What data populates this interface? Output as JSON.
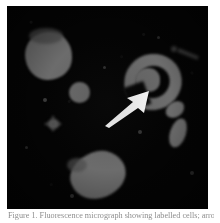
{
  "figure": {
    "caption_label": "Figure 1.",
    "caption_text": "Figure 1.  Fluorescence micrograph showing labelled cells; arrow indicates ring-shaped cell.",
    "panel_background_color": "#040404",
    "cell_color": "#6c6c6c",
    "arrow_color": "#ffffff",
    "page_background_color": "#ffffff"
  },
  "micrograph": {
    "name": "fluorescence-micrograph",
    "annotation": {
      "type": "arrow",
      "direction": "up-right",
      "points_at": "ring-shaped-cell",
      "color": "#ffffff"
    },
    "objects": [
      {
        "id": "cell-top-left",
        "shape": "round-blob",
        "x": 18,
        "y": 26,
        "w": 47,
        "h": 48
      },
      {
        "id": "cell-mid-left",
        "shape": "small-blob",
        "x": 62,
        "y": 76,
        "w": 21,
        "h": 21
      },
      {
        "id": "cell-ring",
        "shape": "ring",
        "x": 117,
        "y": 48,
        "w": 58,
        "h": 56
      },
      {
        "id": "cell-right-upper",
        "shape": "oval-blob",
        "x": 160,
        "y": 98,
        "w": 19,
        "h": 16
      },
      {
        "id": "cell-right-lower",
        "shape": "oval-blob",
        "x": 163,
        "y": 112,
        "w": 17,
        "h": 31
      },
      {
        "id": "cell-bottom",
        "shape": "round-blob",
        "x": 63,
        "y": 145,
        "w": 56,
        "h": 48
      },
      {
        "id": "speck-star",
        "shape": "star-speck",
        "x": 40,
        "y": 112,
        "w": 11,
        "h": 11
      },
      {
        "id": "streak-top-right",
        "shape": "streak",
        "x": 170,
        "y": 47,
        "w": 22,
        "h": 5
      }
    ]
  }
}
